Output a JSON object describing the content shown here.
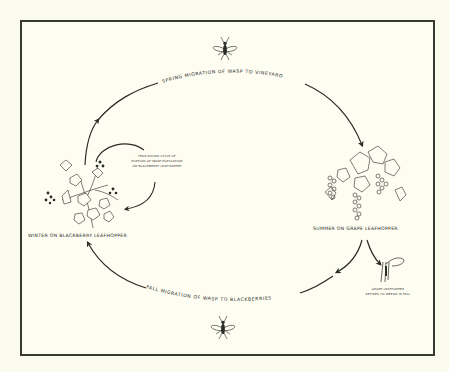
{
  "diagram": {
    "type": "life-cycle",
    "background": "#fbfbee",
    "ink_color": "#2a2a26",
    "arc_labels": {
      "spring": "Spring migration of wasp to vineyard",
      "fall": "Fall migration of wasp to blackberries"
    },
    "nodes": {
      "winter": {
        "label": "Winter on blackberry leafhopper",
        "illustration": "blackberry-branch"
      },
      "summer": {
        "label": "Summer on grape leafhopper",
        "illustration": "grape-cluster"
      }
    },
    "annotations": {
      "year_round": [
        "Year-round cycle of",
        "portion of wasp population",
        "on blackberry leafhopper"
      ],
      "grape_leafhopper": [
        "Grape leafhopper",
        "retires to weeds in fall"
      ]
    },
    "icons": {
      "top": "wasp-icon",
      "bottom": "wasp-icon",
      "weed": "weed-stem-icon"
    }
  }
}
